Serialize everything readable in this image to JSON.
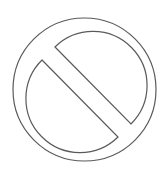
{
  "icon": {
    "name": "prohibited-icon",
    "stroke_color": "#5a5a5a",
    "background_color": "#ffffff",
    "outer_circle": {
      "cx": 84.5,
      "cy": 89.5,
      "r": 71.5
    },
    "inner_circle": {
      "cx": 85.5,
      "cy": 87.5,
      "r": 52.5
    },
    "slash_lines": [
      {
        "x1": 55,
        "y1": 47,
        "x2": 131,
        "y2": 124
      },
      {
        "x1": 42,
        "y1": 60,
        "x2": 118,
        "y2": 137
      }
    ]
  }
}
